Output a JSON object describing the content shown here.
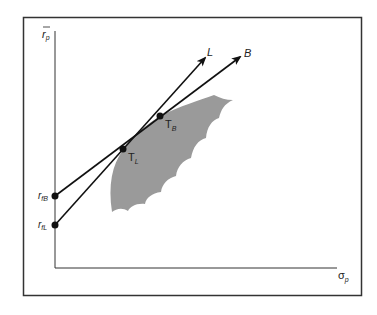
{
  "diagram": {
    "type": "efficient-frontier-tangency",
    "axes": {
      "y_label": "r",
      "y_label_bar": true,
      "y_label_sub": "p",
      "x_label": "σ",
      "x_label_sub": "p"
    },
    "points": {
      "rfB": {
        "label": "r",
        "sub": "fB"
      },
      "rfL": {
        "label": "r",
        "sub": "fL"
      },
      "TL": {
        "label": "T",
        "sub": "L"
      },
      "TB": {
        "label": "T",
        "sub": "B"
      }
    },
    "lines": {
      "L": {
        "label": "L"
      },
      "B": {
        "label": "B"
      }
    },
    "colors": {
      "frame": "#333333",
      "region": "#9a9a9a",
      "line": "#111111",
      "background": "#ffffff"
    }
  }
}
